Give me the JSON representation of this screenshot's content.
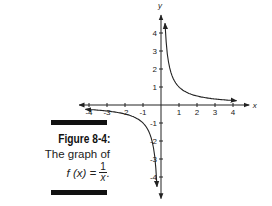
{
  "caption": {
    "figure_label": "Figure 8-4:",
    "description": "The graph of",
    "formula_lhs": "f (x) = ",
    "formula_num": "1",
    "formula_den": "x",
    "formula_end": "."
  },
  "chart_data": {
    "type": "line",
    "xlabel": "x",
    "ylabel": "y",
    "xlim": [
      -4.5,
      4.5
    ],
    "ylim": [
      -5,
      5
    ],
    "x_ticks": [
      -4,
      -3,
      -2,
      -1,
      1,
      2,
      3,
      4
    ],
    "y_ticks": [
      -4,
      -3,
      -2,
      -1,
      1,
      2,
      3,
      4
    ],
    "grid": false,
    "legend": null,
    "series": [
      {
        "name": "f(x) = 1/x (x > 0)",
        "x": [
          0.22,
          0.25,
          0.33,
          0.5,
          0.75,
          1,
          1.5,
          2,
          3,
          4.2
        ],
        "y": [
          4.5,
          4,
          3,
          2,
          1.33,
          1,
          0.67,
          0.5,
          0.33,
          0.24
        ]
      },
      {
        "name": "f(x) = 1/x (x < 0)",
        "x": [
          -4.2,
          -3,
          -2,
          -1.5,
          -1,
          -0.75,
          -0.5,
          -0.33,
          -0.25,
          -0.22
        ],
        "y": [
          -0.24,
          -0.33,
          -0.5,
          -0.67,
          -1,
          -1.33,
          -2,
          -3,
          -4,
          -4.5
        ]
      }
    ],
    "annotations": [
      "asymptote arrows on both branches and both axes"
    ]
  }
}
